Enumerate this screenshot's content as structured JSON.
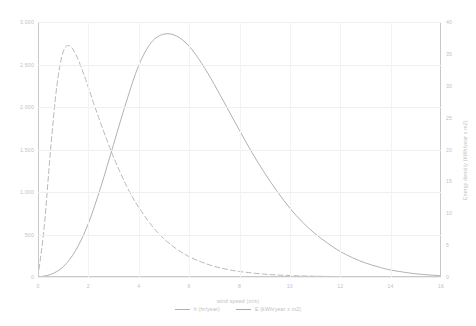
{
  "chart_data": {
    "type": "line",
    "title": "",
    "xlabel": "wind speed (m/s)",
    "ylabel": "Frequency (hrs/year)",
    "y2label": "Energy density (kWh/year x m2)",
    "xlim": [
      0,
      16
    ],
    "ylim": [
      0,
      3000
    ],
    "y2lim": [
      0,
      40
    ],
    "grid": true,
    "legend_position": "bottom-center",
    "xticks": [
      "0",
      "2",
      "4",
      "6",
      "8",
      "10",
      "12",
      "14",
      "16"
    ],
    "xtick_values": [
      0,
      2,
      4,
      6,
      8,
      10,
      12,
      14,
      16
    ],
    "yticks": [
      "0",
      "500",
      "1.000",
      "1.500",
      "2.000",
      "2.500",
      "3.000"
    ],
    "ytick_values": [
      0,
      500,
      1000,
      1500,
      2000,
      2500,
      3000
    ],
    "y2ticks": [
      "0",
      "5",
      "10",
      "15",
      "20",
      "25",
      "30",
      "35",
      "40"
    ],
    "y2tick_values": [
      0,
      5,
      10,
      15,
      20,
      25,
      30,
      35,
      40
    ],
    "series": [
      {
        "name": "h (hr/year)",
        "axis": "left",
        "style": "dashed",
        "color": "#b0b0b0",
        "x": [
          0,
          0.25,
          0.5,
          0.75,
          1,
          1.25,
          1.5,
          1.75,
          2,
          2.25,
          2.5,
          2.75,
          3,
          3.25,
          3.5,
          3.75,
          4,
          4.5,
          5,
          5.5,
          6,
          6.5,
          7,
          7.5,
          8,
          9,
          10,
          11,
          12,
          13,
          14,
          15,
          16
        ],
        "values": [
          0,
          600,
          1500,
          2250,
          2650,
          2720,
          2620,
          2440,
          2230,
          2010,
          1800,
          1600,
          1410,
          1240,
          1080,
          940,
          820,
          610,
          450,
          330,
          240,
          175,
          125,
          90,
          65,
          33,
          17,
          9,
          5,
          3,
          2,
          1,
          0
        ]
      },
      {
        "name": "E (kWh/year x m2)",
        "axis": "right",
        "style": "solid",
        "color": "#a8a8a8",
        "x": [
          0,
          0.5,
          1,
          1.5,
          2,
          2.5,
          3,
          3.5,
          4,
          4.5,
          5,
          5.5,
          6,
          6.5,
          7,
          7.5,
          8,
          8.5,
          9,
          9.5,
          10,
          10.5,
          11,
          11.5,
          12,
          12.5,
          13,
          13.5,
          14,
          15,
          16
        ],
        "values": [
          0,
          0.4,
          1.6,
          4.2,
          8.4,
          14.2,
          20.8,
          27.4,
          33.2,
          36.8,
          38.1,
          37.8,
          36.2,
          33.5,
          30.2,
          26.6,
          23.0,
          19.5,
          16.3,
          13.4,
          10.8,
          8.6,
          6.8,
          5.3,
          4.0,
          3.0,
          2.2,
          1.6,
          1.1,
          0.5,
          0.2
        ]
      }
    ]
  }
}
